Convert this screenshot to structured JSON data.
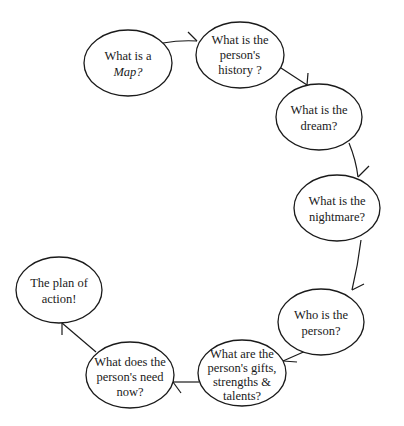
{
  "diagram": {
    "type": "cycle-flow",
    "colors": {
      "stroke": "#1a1a1a",
      "background": "#ffffff",
      "text": "#1a1a1a"
    },
    "nodes": [
      {
        "id": "map",
        "lines": [
          "What is a",
          "Map?"
        ],
        "italic_word": "Map"
      },
      {
        "id": "history",
        "lines": [
          "What is the",
          "person's",
          "history ?"
        ]
      },
      {
        "id": "dream",
        "lines": [
          "What is the",
          "dream?"
        ]
      },
      {
        "id": "nightmare",
        "lines": [
          "What is the",
          "nightmare?"
        ]
      },
      {
        "id": "who",
        "lines": [
          "Who is the",
          "person?"
        ]
      },
      {
        "id": "gifts",
        "lines": [
          "What are the",
          "person's gifts,",
          "strengths &",
          "talents?"
        ]
      },
      {
        "id": "need",
        "lines": [
          "What does the",
          "person's need",
          "now?"
        ]
      },
      {
        "id": "plan",
        "lines": [
          "The plan of",
          "action!"
        ]
      }
    ],
    "edges": [
      {
        "from": "map",
        "to": "history"
      },
      {
        "from": "history",
        "to": "dream"
      },
      {
        "from": "dream",
        "to": "nightmare"
      },
      {
        "from": "nightmare",
        "to": "who"
      },
      {
        "from": "who",
        "to": "gifts"
      },
      {
        "from": "gifts",
        "to": "need"
      },
      {
        "from": "need",
        "to": "plan"
      }
    ]
  }
}
